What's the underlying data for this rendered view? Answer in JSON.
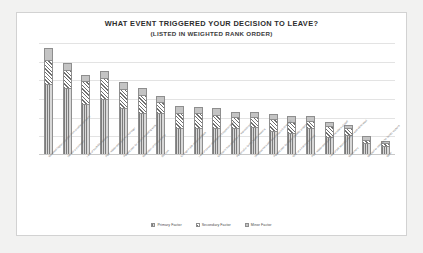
{
  "chart_data": {
    "type": "bar",
    "title": "WHAT EVENT TRIGGERED YOUR DECISION TO LEAVE?",
    "subtitle": "(LISTED IN WEIGHTED RANK ORDER)",
    "xlabel": "",
    "ylabel": "",
    "grid": true,
    "stacked": true,
    "legend_position": "bottom-center",
    "ylim": [
      0,
      100
    ],
    "categories": [
      "Received higher pay offer from another company",
      "Denied a promotion",
      "Lack of work/life balance",
      "Poor relationship with my manager",
      "Passed over for more interesting work",
      "Relocation of the company",
      "Burnout",
      "Change in job responsibilities",
      "Lack of career development opportunities",
      "Company was acquired or restructured",
      "Personal or family health reasons",
      "Disagreement with the company's direction",
      "Passed over for higher visibility project",
      "Offer of a training contract",
      "Poor relationship with the members of staff",
      "Lack of job security, position was eliminated",
      "Retirement",
      "Needed to relocate for family reasons",
      "Other"
    ],
    "series": [
      {
        "name": "Primary Factor",
        "pattern": "vertical-stripes",
        "values": [
          62,
          58,
          44,
          48,
          40,
          36,
          36,
          22,
          22,
          22,
          22,
          23,
          20,
          18,
          22,
          14,
          16,
          9,
          6
        ]
      },
      {
        "name": "Secondary Factor",
        "pattern": "diagonal-hatch",
        "values": [
          21,
          16,
          20,
          19,
          17,
          16,
          10,
          14,
          14,
          12,
          10,
          9,
          10,
          10,
          7,
          10,
          6,
          3,
          3
        ]
      },
      {
        "name": "Minor Factor",
        "pattern": "solid-light-grey",
        "values": [
          11,
          6,
          6,
          6,
          6,
          6,
          5,
          6,
          5,
          6,
          5,
          5,
          5,
          5,
          4,
          4,
          3,
          3,
          2
        ]
      }
    ],
    "gridline_count": 6,
    "colors": {
      "primary": "#7c7c7c",
      "secondary": "#6f6f6f",
      "minor": "#c4c4c4",
      "gridline": "#e3e3e3",
      "panel_background": "#ffffff",
      "page_background": "#f2f2f1",
      "panel_border": "#d2d2d2",
      "title_text": "#2d2d2d",
      "label_text": "#6a6a6a"
    }
  },
  "legend": {
    "items": [
      {
        "label": "Primary Factor"
      },
      {
        "label": "Secondary Factor"
      },
      {
        "label": "Minor Factor"
      }
    ]
  }
}
